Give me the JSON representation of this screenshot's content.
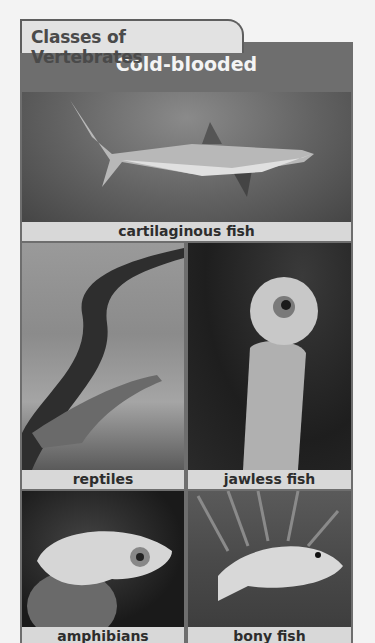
{
  "tab_title": "Classes of Vertebrates",
  "header": "Cold-blooded",
  "panels": [
    {
      "label": "cartilaginous fish",
      "image": "shark-photo"
    },
    {
      "label": "reptiles",
      "image": "lizard-photo"
    },
    {
      "label": "jawless fish",
      "image": "lamprey-photo"
    },
    {
      "label": "amphibians",
      "image": "frog-photo"
    },
    {
      "label": "bony fish",
      "image": "fish-photo"
    }
  ],
  "colors": {
    "frame": "#6e6e6e",
    "tab_bg": "#e2e2e2",
    "label_bg": "#d8d8d8",
    "page_bg": "#f3f3f3"
  }
}
